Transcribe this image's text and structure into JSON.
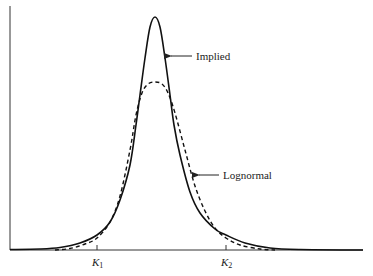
{
  "chart_data": {
    "type": "line",
    "title": "",
    "xlabel": "",
    "ylabel": "",
    "grid": false,
    "legend": "inline arrow annotations",
    "x_ticks": [
      {
        "label": "K",
        "sub": "1",
        "px": 97
      },
      {
        "label": "K",
        "sub": "2",
        "px": 226
      }
    ],
    "series": [
      {
        "name": "Implied",
        "style": "solid",
        "points": [
          [
            10,
            249.5
          ],
          [
            40,
            249
          ],
          [
            60,
            247.5
          ],
          [
            80,
            243
          ],
          [
            97,
            235
          ],
          [
            110,
            222
          ],
          [
            120,
            200
          ],
          [
            130,
            165
          ],
          [
            136,
            125
          ],
          [
            140,
            95
          ],
          [
            145,
            58
          ],
          [
            150,
            27
          ],
          [
            155,
            17
          ],
          [
            160,
            27
          ],
          [
            165,
            58
          ],
          [
            170,
            95
          ],
          [
            174,
            125
          ],
          [
            180,
            155
          ],
          [
            190,
            192
          ],
          [
            200,
            213
          ],
          [
            215,
            229
          ],
          [
            226,
            235
          ],
          [
            245,
            243
          ],
          [
            270,
            248
          ],
          [
            300,
            249.5
          ],
          [
            363,
            250
          ]
        ]
      },
      {
        "name": "Lognormal",
        "style": "dashed",
        "points": [
          [
            55,
            250
          ],
          [
            70,
            248.5
          ],
          [
            85,
            244
          ],
          [
            97,
            238
          ],
          [
            110,
            222
          ],
          [
            120,
            196
          ],
          [
            130,
            150
          ],
          [
            136,
            115
          ],
          [
            142,
            93
          ],
          [
            148,
            84
          ],
          [
            155,
            82
          ],
          [
            162,
            84
          ],
          [
            168,
            93
          ],
          [
            175,
            113
          ],
          [
            185,
            150
          ],
          [
            195,
            186
          ],
          [
            205,
            211
          ],
          [
            215,
            228
          ],
          [
            226,
            238
          ],
          [
            240,
            245
          ],
          [
            260,
            249
          ],
          [
            275,
            250
          ]
        ]
      }
    ],
    "annotations": [
      {
        "text": "Implied",
        "arrow_tip": [
          169,
          56
        ],
        "arrow_tail": [
          192,
          56
        ],
        "text_pos": [
          196,
          60
        ]
      },
      {
        "text": "Lognormal",
        "arrow_tip": [
          197,
          175
        ],
        "arrow_tail": [
          219,
          175
        ],
        "text_pos": [
          223,
          179
        ]
      }
    ],
    "axes": {
      "origin": [
        10,
        250
      ],
      "x_end": 363,
      "y_top": 6
    }
  },
  "labels": {
    "implied": "Implied",
    "lognormal": "Lognormal",
    "k1": "K",
    "k1_sub": "1",
    "k2": "K",
    "k2_sub": "2"
  }
}
